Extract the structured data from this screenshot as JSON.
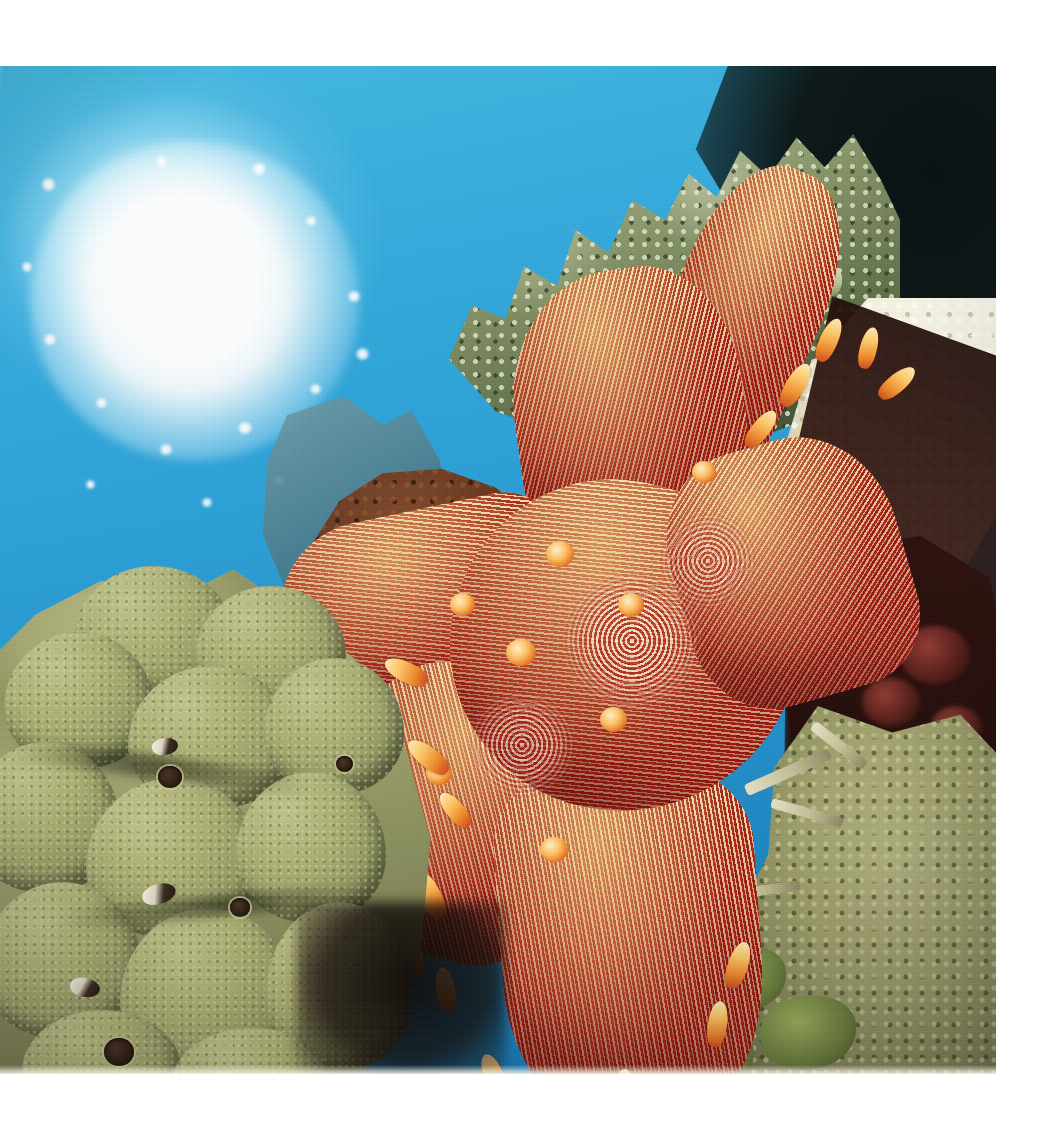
{
  "page": {
    "background_color": "#ffffff",
    "width": 1051,
    "height": 1134
  },
  "photograph": {
    "name": "underwater-coral-reef-photo",
    "kind": "natural-image",
    "subject": "Red and white striped sea star (cushion star) resting on coral reef",
    "frame": {
      "left": 0,
      "top": 66,
      "width": 996,
      "height": 1008
    },
    "alt_text": "Sunlit tropical reef scene: a large orange-red sea star with cream radiating stripes sprawls across coral heads; olive lobate coral at left, green-grey staghorn coral above, blue water and a sunburst top-left."
  },
  "scene": {
    "lighting": "sunburst flare in upper-left water column, strong backlight",
    "elements": [
      {
        "name": "sun-flare",
        "label": "Sun flare through water surface",
        "center_x": 175,
        "center_y": 230,
        "color": "#ffffff"
      },
      {
        "name": "open-water",
        "label": "Blue open water column",
        "color_near": "#41b7e2",
        "color_far": "#1578b4"
      },
      {
        "name": "staghorn-coral",
        "label": "Branching Acropora (staghorn/table) coral",
        "color": "#7d8b5e",
        "tip_color": "#dfe4c0"
      },
      {
        "name": "lobate-coral",
        "label": "Olive lobate massive coral head",
        "color": "#a8ad78"
      },
      {
        "name": "brown-encrusting-coral",
        "label": "Dark red-brown encrusting coral",
        "color": "#6b3a22"
      },
      {
        "name": "limestone-ledge",
        "label": "Pale limestone / dead coral ledge",
        "color": "#f2efd9"
      },
      {
        "name": "reef-shadow-cavity",
        "label": "Dark reef cavity and shadow",
        "color": "#1b0c09"
      },
      {
        "name": "olive-encrusting-reef",
        "label": "Olive encrusting reef and coral rubble",
        "color": "#9ea06e"
      },
      {
        "name": "sea-star",
        "label": "Sea star with radiating cream and crimson stripes",
        "stripe_light": "#fffcec",
        "stripe_dark": "#a8220f",
        "spine_color": "#ffc968",
        "sunlit_color": "#ffd27a",
        "arm_count": 5
      }
    ]
  },
  "caption": {
    "text": "",
    "visible": false
  }
}
